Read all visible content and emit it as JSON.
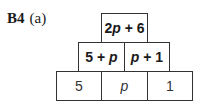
{
  "question": {
    "number": "B4",
    "part": "(a)"
  },
  "pyramid": {
    "top": [
      {
        "text": "2p + 6"
      }
    ],
    "middle": [
      {
        "text": "5 + p"
      },
      {
        "text": "p + 1"
      }
    ],
    "bottom": [
      {
        "text": "5"
      },
      {
        "text": "p"
      },
      {
        "text": "1"
      }
    ]
  }
}
